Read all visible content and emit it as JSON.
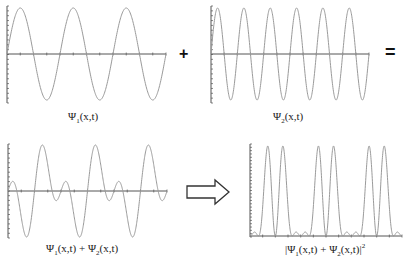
{
  "colors": {
    "curve": "#9a9a9a",
    "axis": "#555555",
    "text": "#222222",
    "operator": "#111111",
    "arrow_stroke": "#333333",
    "background": "#ffffff"
  },
  "operators": {
    "plus": "+",
    "equals": "="
  },
  "labels": {
    "psi1": {
      "psi": "Ψ",
      "sub": "1",
      "rest": "(x,t)"
    },
    "psi2": {
      "psi": "Ψ",
      "sub": "2",
      "rest": "(x,t)"
    },
    "sum": {
      "psi_a": "Ψ",
      "sub_a": "1",
      "rest_a": "(x,t) + ",
      "psi_b": "Ψ",
      "sub_b": "2",
      "rest_b": "(x,t)"
    },
    "prob": {
      "open": "|",
      "psi_a": "Ψ",
      "sub_a": "1",
      "rest_a": "(x,t) + ",
      "psi_b": "Ψ",
      "sub_b": "2",
      "rest_b": "(x,t)|",
      "sup": "2"
    }
  },
  "arrow": {
    "icon": "right-arrow-outline"
  },
  "chart_data": [
    {
      "type": "line",
      "title": "Ψ1(x,t)",
      "description": "sinusoid, 3 periods across the plot",
      "cycles": 3,
      "amplitude": 1,
      "axis": "horizontal at y=0",
      "grid": false
    },
    {
      "type": "line",
      "title": "Ψ2(x,t)",
      "description": "sinusoid, 6 periods across the plot (twice the frequency of Ψ1)",
      "cycles": 6,
      "amplitude": 1,
      "axis": "horizontal at y=0",
      "grid": false
    },
    {
      "type": "line",
      "title": "Ψ1(x,t) + Ψ2(x,t)",
      "description": "superposition of the two waves",
      "components_cycles": [
        3,
        6
      ],
      "grid": false
    },
    {
      "type": "line",
      "title": "|Ψ1(x,t) + Ψ2(x,t)|²",
      "description": "probability density; six tall peaks with small bumps near zero",
      "peaks_x_px": [
        256,
        293,
        309,
        344,
        360,
        395
      ],
      "grid": false
    }
  ]
}
